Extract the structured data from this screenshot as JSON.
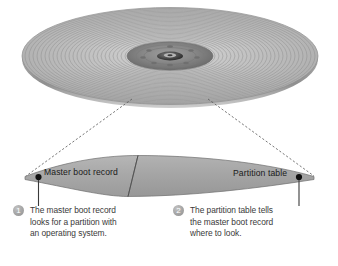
{
  "figure": {
    "background_color": "#ffffff"
  },
  "disk": {
    "name": "disk-platter",
    "description": "hard disk platter drawn in perspective with concentric tracks",
    "surface_color": "#b9b9b9",
    "track_color": "#8c8c8c",
    "hub_color": "#6d6d6d",
    "edge_color": "#9a9a9a"
  },
  "band": {
    "name": "track-band",
    "description": "magnified curved band of the outermost track",
    "fill_color": "#a9a9a9",
    "stroke_color": "#6f6f6f",
    "divider_color": "#555555"
  },
  "leaders": {
    "style": "dashed",
    "color": "#555555"
  },
  "band_labels": {
    "left": "Master boot record",
    "right": "Partition table"
  },
  "callouts": [
    {
      "number": "1",
      "lines": [
        "The master boot record",
        "looks for a partition with",
        "an operating system."
      ],
      "badge_color": "#a0a0a0"
    },
    {
      "number": "2",
      "lines": [
        "The partition table tells",
        "the master boot record",
        "where to look."
      ],
      "badge_color": "#a0a0a0"
    }
  ],
  "rule": {
    "name": "bottom-rule",
    "color": "#6f6f6f"
  }
}
